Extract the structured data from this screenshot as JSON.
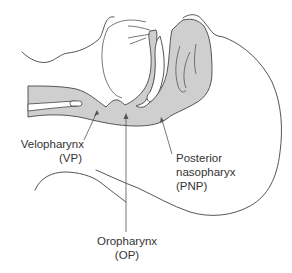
{
  "diagram": {
    "type": "anatomical cross-section",
    "colors": {
      "airway_fill": "#cfcfcf",
      "outline": "#555555",
      "label_text": "#333333",
      "background": "#ffffff"
    },
    "labels": [
      {
        "id": "vp",
        "line1": "Velopharynx",
        "line2": "(VP)"
      },
      {
        "id": "pnp",
        "line1": "Posterior",
        "line2": "nasopharyx",
        "line3": "(PNP)"
      },
      {
        "id": "op",
        "line1": "Oropharynx",
        "line2": "(OP)"
      }
    ]
  }
}
